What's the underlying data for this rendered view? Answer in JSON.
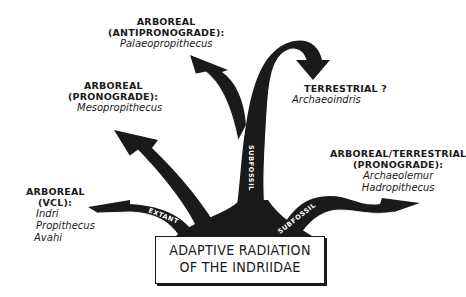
{
  "title": {
    "line1": "ADAPTIVE RADIATION",
    "line2": "OF THE INDRIIDAE"
  },
  "groups": [
    {
      "id": "antipronograde",
      "heading1": "ARBOREAL",
      "heading2": "(ANTIPRONOGRADE):",
      "taxa": [
        "Palaeopropithecus"
      ]
    },
    {
      "id": "pronograde",
      "heading1": "ARBOREAL",
      "heading2": "(PRONOGRADE):",
      "taxa": [
        "Mesopropithecus"
      ]
    },
    {
      "id": "terrestrial",
      "heading1": "TERRESTRIAL ?",
      "taxa": [
        "Archaeoindris"
      ]
    },
    {
      "id": "arboreal-terrestrial",
      "heading1": "ARBOREAL/TERRESTRIAL",
      "heading2": "(PRONOGRADE):",
      "taxa": [
        "Archaeolemur",
        "Hadropithecus"
      ]
    },
    {
      "id": "vcl",
      "heading1": "ARBOREAL",
      "heading2": "(VCL):",
      "taxa": [
        "Indri",
        "Propithecus",
        "Avahi"
      ]
    }
  ],
  "branch_labels": {
    "extant": "EXTANT",
    "subfossil_left": "SUBFOSSIL",
    "subfossil_center": "SUBFOSSIL",
    "subfossil_right": "SUBFOSSIL"
  },
  "colors": {
    "ink": "#1a1a1a",
    "background": "#ffffff"
  }
}
